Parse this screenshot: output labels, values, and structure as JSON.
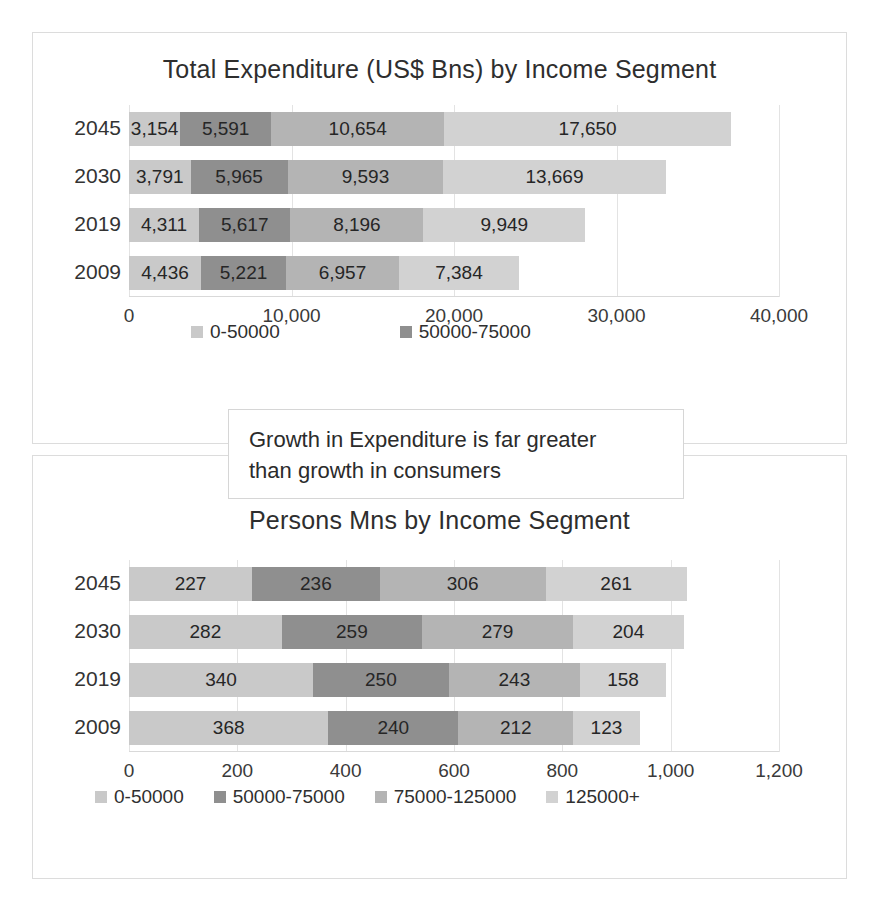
{
  "chart_data": [
    {
      "type": "bar",
      "orientation": "horizontal",
      "stacked": true,
      "title": "Total Expenditure (US$ Bns) by Income Segment",
      "xlabel": "",
      "ylabel": "",
      "categories": [
        "2045",
        "2030",
        "2019",
        "2009"
      ],
      "tick_labels": [
        "0",
        "10,000",
        "20,000",
        "30,000",
        "40,000"
      ],
      "tick_values": [
        0,
        10000,
        20000,
        30000,
        40000
      ],
      "xlim": [
        0,
        40000
      ],
      "grid": true,
      "legend_position": "bottom",
      "legend_entries": [
        "0-50000",
        "50000-75000"
      ],
      "series": [
        {
          "name": "0-50000",
          "color": "#c9c9c9",
          "values": [
            3154,
            3791,
            4311,
            4436
          ],
          "labels": [
            "3,154",
            "3,791",
            "4,311",
            "4,436"
          ]
        },
        {
          "name": "50000-75000",
          "color": "#8f8f8f",
          "values": [
            5591,
            5965,
            5617,
            5221
          ],
          "labels": [
            "5,591",
            "5,965",
            "5,617",
            "5,221"
          ]
        },
        {
          "name": "75000-125000",
          "color": "#b4b4b4",
          "values": [
            10654,
            9593,
            8196,
            6957
          ],
          "labels": [
            "10,654",
            "9,593",
            "8,196",
            "6,957"
          ]
        },
        {
          "name": "125000+",
          "color": "#d2d2d2",
          "values": [
            17650,
            13669,
            9949,
            7384
          ],
          "labels": [
            "17,650",
            "13,669",
            "9,949",
            "7,384"
          ]
        }
      ]
    },
    {
      "type": "bar",
      "orientation": "horizontal",
      "stacked": true,
      "title": "Persons Mns by Income Segment",
      "xlabel": "",
      "ylabel": "",
      "categories": [
        "2045",
        "2030",
        "2019",
        "2009"
      ],
      "tick_labels": [
        "0",
        "200",
        "400",
        "600",
        "800",
        "1,000",
        "1,200"
      ],
      "tick_values": [
        0,
        200,
        400,
        600,
        800,
        1000,
        1200
      ],
      "xlim": [
        0,
        1200
      ],
      "grid": true,
      "legend_position": "bottom",
      "legend_entries": [
        "0-50000",
        "50000-75000",
        "75000-125000",
        "125000+"
      ],
      "series": [
        {
          "name": "0-50000",
          "color": "#c9c9c9",
          "values": [
            227,
            282,
            340,
            368
          ],
          "labels": [
            "227",
            "282",
            "340",
            "368"
          ]
        },
        {
          "name": "50000-75000",
          "color": "#8f8f8f",
          "values": [
            236,
            259,
            250,
            240
          ],
          "labels": [
            "236",
            "259",
            "250",
            "240"
          ]
        },
        {
          "name": "75000-125000",
          "color": "#b4b4b4",
          "values": [
            306,
            279,
            243,
            212
          ],
          "labels": [
            "306",
            "279",
            "243",
            "212"
          ]
        },
        {
          "name": "125000+",
          "color": "#d2d2d2",
          "values": [
            261,
            204,
            158,
            123
          ],
          "labels": [
            "261",
            "204",
            "158",
            "123"
          ]
        }
      ]
    }
  ],
  "callout": {
    "line1": "Growth in Expenditure is far greater",
    "line2": "than growth in consumers"
  },
  "colors": {
    "series_0_50000": "#c9c9c9",
    "series_50000_75000": "#8f8f8f",
    "series_75000_125000": "#b4b4b4",
    "series_125000_plus": "#d2d2d2",
    "frame_border": "#dcdcdc",
    "gridline": "#e3e3e3",
    "text": "#2b2b2b"
  }
}
